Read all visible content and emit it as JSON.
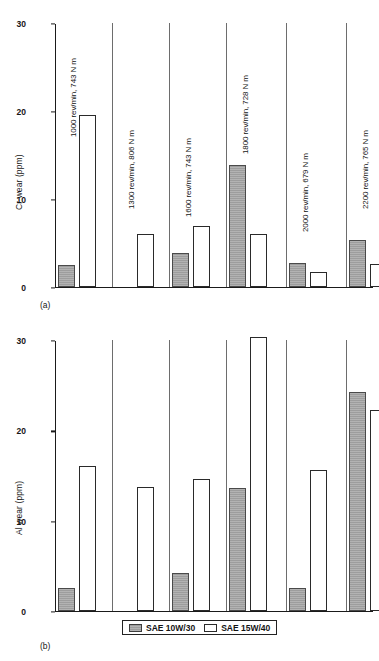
{
  "figure": {
    "panel_a_caption": "(a)",
    "panel_b_caption": "(b)"
  },
  "legend": {
    "position": "bottom-center",
    "entries": [
      {
        "label": "SAE 10W/30",
        "style": "gray",
        "color": "#9d9d9d"
      },
      {
        "label": "SAE 15W/40",
        "style": "white",
        "color": "#ffffff"
      }
    ]
  },
  "chart_data": [
    {
      "type": "bar",
      "panel": "(a)",
      "title": "",
      "xlabel": "",
      "ylabel": "Cr wear (ppm)",
      "ylim": [
        0,
        30
      ],
      "yticks": [
        0,
        10,
        20,
        30
      ],
      "ytick_labels": [
        "0",
        "10",
        "20",
        "30"
      ],
      "grid": false,
      "categories": [
        "1000 rev/min, 743 N m",
        "1300 rev/min, 806 N m",
        "1600 rev/min, 743 N m",
        "1800 rev/min, 728 N m",
        "2000 rev/min, 679 N m",
        "2200 rev/min, 765 N m"
      ],
      "series": [
        {
          "name": "SAE 10W/30",
          "style": "gray",
          "values": [
            2.5,
            0,
            3.9,
            13.9,
            2.7,
            5.3
          ]
        },
        {
          "name": "SAE 15W/40",
          "style": "white",
          "values": [
            19.5,
            6.0,
            6.9,
            6.0,
            1.7,
            2.6
          ]
        }
      ]
    },
    {
      "type": "bar",
      "panel": "(b)",
      "title": "",
      "xlabel": "",
      "ylabel": "Al wear (ppm)",
      "ylim": [
        0,
        30
      ],
      "yticks": [
        0,
        10,
        20,
        30
      ],
      "ytick_labels": [
        "0",
        "10",
        "20",
        "30"
      ],
      "grid": false,
      "categories": [
        "1000 rev/min, 743 N m",
        "1300 rev/min, 806 N m",
        "1600 rev/min, 743 N m",
        "1800 rev/min, 728 N m",
        "2000 rev/min, 679 N m",
        "2200 rev/min, 765 N m"
      ],
      "series": [
        {
          "name": "SAE 10W/30",
          "style": "gray",
          "values": [
            2.6,
            0,
            4.2,
            13.6,
            2.5,
            24.3
          ]
        },
        {
          "name": "SAE 15W/40",
          "style": "white",
          "values": [
            16.1,
            13.7,
            14.6,
            30.3,
            15.6,
            22.2
          ]
        }
      ]
    }
  ]
}
